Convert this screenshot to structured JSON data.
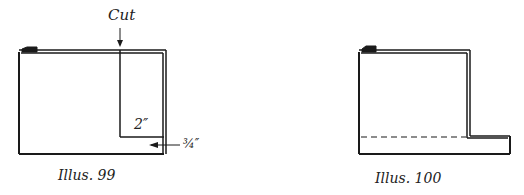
{
  "illustrations": [
    {
      "caption": "Illus. 99",
      "labels": {
        "cut": "Cut",
        "height": "2″",
        "width": "¾″"
      }
    },
    {
      "caption": "Illus. 100"
    }
  ],
  "colors": {
    "line": "#1a1a1a",
    "background": "#ffffff"
  }
}
